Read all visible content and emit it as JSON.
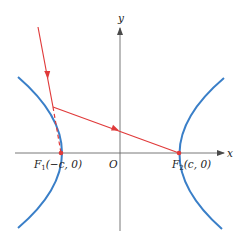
{
  "diagram": {
    "type": "hyperbola-reflection",
    "colors": {
      "curve": "#3a7fc8",
      "ray": "#e03a3a",
      "axis": "#6a6a6a",
      "text": "#222222"
    },
    "axes": {
      "x_label": "x",
      "y_label": "y",
      "origin_label": "O"
    },
    "foci": [
      {
        "name": "F1",
        "letter": "F",
        "subscript": "1",
        "coords": "(−c, 0)"
      },
      {
        "name": "F2",
        "letter": "F",
        "subscript": "2",
        "coords": "(c, 0)"
      }
    ]
  }
}
